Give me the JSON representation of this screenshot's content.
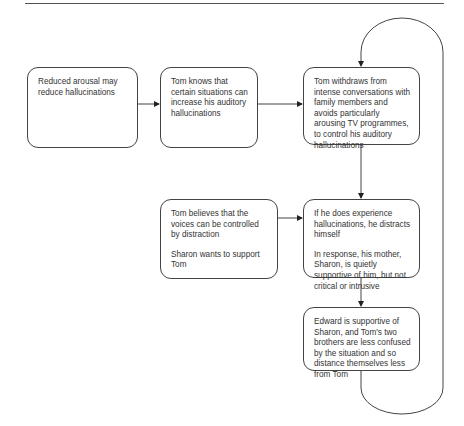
{
  "diagram": {
    "type": "flowchart",
    "boxes": [
      {
        "id": "reduced-arousal",
        "paragraphs": [
          "Reduced arousal may reduce hallucinations"
        ]
      },
      {
        "id": "tom-knows",
        "paragraphs": [
          "Tom  knows that certain situations can increase his auditory hallucinations"
        ]
      },
      {
        "id": "tom-withdraws",
        "paragraphs": [
          "Tom withdraws from intense conversations with  family members and avoids particularly arousing TV programmes, to control his auditory hallucinations"
        ]
      },
      {
        "id": "tom-believes",
        "paragraphs": [
          "Tom  believes that the voices can be controlled by distraction",
          "Sharon wants to support Tom"
        ]
      },
      {
        "id": "distracts-himself",
        "paragraphs": [
          "If he does experience hallucinations, he distracts himself",
          "In response, his mother, Sharon, is quietly supportive of him, but not critical or intrusive"
        ]
      },
      {
        "id": "edward-supportive",
        "paragraphs": [
          "Edward is supportive of Sharon, and Tom's two brothers are less confused by the situation and so distance themselves less from Tom"
        ]
      }
    ],
    "edges": [
      {
        "from": "reduced-arousal",
        "to": "tom-knows"
      },
      {
        "from": "tom-knows",
        "to": "tom-withdraws"
      },
      {
        "from": "tom-withdraws",
        "to": "distracts-himself"
      },
      {
        "from": "tom-believes",
        "to": "distracts-himself"
      },
      {
        "from": "distracts-himself",
        "to": "edward-supportive"
      },
      {
        "from": "edward-supportive",
        "to": "tom-withdraws",
        "style": "feedback-loop"
      }
    ],
    "colors": {
      "stroke": "#444444",
      "text": "#333333",
      "background": "#ffffff"
    }
  }
}
